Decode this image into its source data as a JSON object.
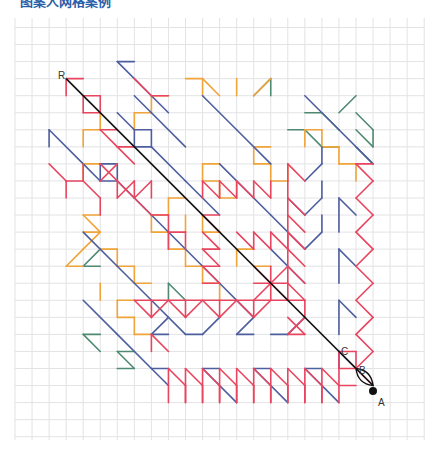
{
  "title": "图案人网格案例",
  "grid": {
    "x0": 15,
    "y0": 27.5,
    "step": 17.05,
    "cols": 24,
    "rows": 24,
    "top": 18,
    "bottom": 440,
    "left": 15,
    "right": 425,
    "color": "#e3e3e6"
  },
  "colors": {
    "blue": "#4d5f9e",
    "orange": "#f0a43a",
    "red": "#e8455f",
    "green": "#4f8a72",
    "black": "#111111"
  },
  "labels": [
    {
      "text": "R",
      "x": 58,
      "y": 79
    },
    {
      "text": "C",
      "x": 341,
      "y": 355
    },
    {
      "text": "B",
      "x": 359,
      "y": 374
    },
    {
      "text": "A",
      "x": 378,
      "y": 406
    }
  ],
  "point_a": {
    "x": 373,
    "y": 391
  },
  "main_diagonal": {
    "from": [
      3,
      3
    ],
    "to": [
      21,
      21
    ]
  },
  "segments": {
    "blue": [
      [
        6,
        2,
        7,
        2
      ],
      [
        6,
        2,
        8,
        4
      ],
      [
        8,
        4,
        9,
        5
      ],
      [
        6,
        5,
        7,
        6
      ],
      [
        7,
        6,
        8,
        6
      ],
      [
        8,
        6,
        8,
        7
      ],
      [
        7,
        6,
        7,
        7
      ],
      [
        7,
        7,
        8,
        7
      ],
      [
        8,
        7,
        10,
        9
      ],
      [
        2,
        6,
        2,
        7
      ],
      [
        2,
        6,
        4,
        8
      ],
      [
        4,
        8,
        5,
        9
      ],
      [
        5,
        8,
        6,
        8
      ],
      [
        5,
        8,
        5,
        9
      ],
      [
        5,
        9,
        6,
        9
      ],
      [
        6,
        9,
        7,
        10
      ],
      [
        6,
        8,
        6,
        9
      ],
      [
        7,
        4,
        8,
        5
      ],
      [
        8,
        5,
        10,
        7
      ],
      [
        11,
        4,
        13,
        6
      ],
      [
        13,
        6,
        15,
        8
      ],
      [
        17,
        4,
        19,
        6
      ],
      [
        19,
        6,
        21,
        8
      ],
      [
        12,
        8,
        15,
        11
      ],
      [
        15,
        11,
        17,
        13
      ],
      [
        10,
        9,
        12,
        11
      ],
      [
        4,
        12,
        6,
        14
      ],
      [
        6,
        14,
        8,
        16
      ],
      [
        8,
        16,
        10,
        18
      ],
      [
        7,
        10,
        8,
        11
      ],
      [
        8,
        11,
        12,
        15
      ],
      [
        12,
        15,
        14,
        17
      ],
      [
        15,
        13,
        17,
        15
      ],
      [
        4,
        16,
        6,
        18
      ],
      [
        6,
        18,
        8,
        20
      ],
      [
        8,
        18,
        9,
        17
      ],
      [
        9,
        18,
        8,
        18
      ],
      [
        10,
        18,
        11,
        18
      ],
      [
        11,
        18,
        12,
        17
      ],
      [
        13,
        18,
        14,
        17
      ],
      [
        14,
        18,
        13,
        18
      ],
      [
        16,
        18,
        17,
        17
      ],
      [
        16,
        18,
        15,
        18
      ],
      [
        8,
        20,
        9,
        20
      ],
      [
        8,
        20,
        9,
        21
      ],
      [
        11,
        20,
        12,
        20
      ],
      [
        11,
        20,
        13,
        22
      ],
      [
        14,
        20,
        15,
        20
      ],
      [
        14,
        20,
        16,
        22
      ],
      [
        17,
        20,
        18,
        20
      ],
      [
        17,
        20,
        19,
        22
      ],
      [
        17,
        11,
        18,
        10
      ],
      [
        17,
        11,
        16,
        10
      ],
      [
        18,
        10,
        18,
        9
      ],
      [
        17,
        9,
        18,
        8
      ],
      [
        18,
        8,
        18,
        7
      ],
      [
        17,
        13,
        18,
        12
      ],
      [
        18,
        12,
        18,
        11
      ],
      [
        19,
        10,
        19,
        12
      ],
      [
        19,
        10,
        20,
        11
      ],
      [
        19,
        13,
        19,
        15
      ],
      [
        19,
        13,
        20,
        14
      ],
      [
        19,
        16,
        19,
        18
      ],
      [
        19,
        16,
        20,
        17
      ],
      [
        19,
        19,
        19,
        20
      ],
      [
        19,
        19,
        20,
        20
      ]
    ],
    "orange": [
      [
        10,
        3,
        11,
        3
      ],
      [
        11,
        3,
        11,
        4
      ],
      [
        8,
        4,
        9,
        4
      ],
      [
        8,
        5,
        8,
        4
      ],
      [
        11,
        3,
        12,
        4
      ],
      [
        13,
        3,
        13,
        4
      ],
      [
        14,
        4,
        15,
        3
      ],
      [
        4,
        6,
        5,
        6
      ],
      [
        4,
        6,
        4,
        7
      ],
      [
        5,
        6,
        5,
        5
      ],
      [
        7,
        5,
        8,
        5
      ],
      [
        7,
        5,
        7,
        6
      ],
      [
        4,
        8,
        5,
        8
      ],
      [
        4,
        8,
        4,
        9
      ],
      [
        11,
        8,
        12,
        8
      ],
      [
        11,
        8,
        11,
        9
      ],
      [
        11,
        9,
        12,
        9
      ],
      [
        12,
        9,
        12,
        10
      ],
      [
        12,
        10,
        13,
        10
      ],
      [
        13,
        9,
        13,
        10
      ],
      [
        14,
        7,
        15,
        7
      ],
      [
        14,
        7,
        14,
        8
      ],
      [
        14,
        8,
        15,
        8
      ],
      [
        15,
        8,
        15,
        9
      ],
      [
        15,
        9,
        16,
        9
      ],
      [
        16,
        8,
        16,
        9
      ],
      [
        17,
        6,
        17,
        7
      ],
      [
        17,
        6,
        18,
        6
      ],
      [
        18,
        6,
        18,
        7
      ],
      [
        18,
        7,
        19,
        7
      ],
      [
        19,
        7,
        19,
        8
      ],
      [
        19,
        8,
        20,
        8
      ],
      [
        20,
        8,
        20,
        9
      ],
      [
        9,
        10,
        10,
        10
      ],
      [
        9,
        10,
        9,
        11
      ],
      [
        10,
        11,
        10,
        12
      ],
      [
        11,
        12,
        12,
        12
      ],
      [
        11,
        11,
        11,
        12
      ],
      [
        4,
        11,
        5,
        11
      ],
      [
        4,
        11,
        5,
        12
      ],
      [
        5,
        12,
        4,
        12
      ],
      [
        4,
        13,
        5,
        12
      ],
      [
        4,
        13,
        3,
        14
      ],
      [
        3,
        14,
        4,
        14
      ],
      [
        8,
        11,
        9,
        11
      ],
      [
        8,
        11,
        8,
        12
      ],
      [
        8,
        12,
        9,
        12
      ],
      [
        9,
        12,
        9,
        13
      ],
      [
        9,
        13,
        10,
        13
      ],
      [
        10,
        13,
        10,
        14
      ],
      [
        10,
        14,
        11,
        14
      ],
      [
        11,
        14,
        11,
        15
      ],
      [
        11,
        15,
        12,
        15
      ],
      [
        12,
        15,
        12,
        16
      ],
      [
        5,
        13,
        6,
        13
      ],
      [
        6,
        13,
        6,
        14
      ],
      [
        6,
        14,
        7,
        14
      ],
      [
        7,
        14,
        7,
        15
      ],
      [
        7,
        15,
        8,
        15
      ],
      [
        5,
        15,
        5,
        16
      ],
      [
        6,
        16,
        7,
        16
      ],
      [
        6,
        16,
        6,
        17
      ],
      [
        6,
        17,
        7,
        17
      ],
      [
        7,
        17,
        7,
        18
      ],
      [
        7,
        18,
        8,
        18
      ],
      [
        13,
        13,
        14,
        13
      ],
      [
        13,
        13,
        13,
        14
      ],
      [
        14,
        14,
        15,
        14
      ]
    ],
    "red": [
      [
        3,
        3,
        3,
        4
      ],
      [
        3,
        3,
        4,
        3
      ],
      [
        4,
        4,
        5,
        4
      ],
      [
        4,
        4,
        4,
        5
      ],
      [
        5,
        4,
        5,
        5
      ],
      [
        4,
        5,
        5,
        5
      ],
      [
        5,
        6,
        6,
        6
      ],
      [
        5,
        6,
        6,
        7
      ],
      [
        6,
        7,
        7,
        7
      ],
      [
        6,
        7,
        7,
        8
      ],
      [
        7,
        3,
        8,
        4
      ],
      [
        8,
        4,
        9,
        4
      ],
      [
        2,
        8,
        3,
        9
      ],
      [
        3,
        9,
        4,
        9
      ],
      [
        3,
        9,
        3,
        10
      ],
      [
        4,
        9,
        4,
        8
      ],
      [
        4,
        9,
        5,
        10
      ],
      [
        5,
        10,
        5,
        11
      ],
      [
        6,
        9,
        6,
        10
      ],
      [
        6,
        10,
        7,
        9
      ],
      [
        7,
        9,
        7,
        10
      ],
      [
        7,
        10,
        8,
        9
      ],
      [
        8,
        9,
        8,
        10
      ],
      [
        5,
        8,
        7,
        10
      ],
      [
        6,
        8,
        5,
        9
      ],
      [
        7,
        10,
        8,
        11
      ],
      [
        8,
        11,
        9,
        11
      ],
      [
        9,
        11,
        9,
        12
      ],
      [
        9,
        12,
        10,
        12
      ],
      [
        10,
        12,
        10,
        13
      ],
      [
        9,
        12,
        9,
        13
      ],
      [
        11,
        9,
        11,
        10
      ],
      [
        11,
        9,
        12,
        10
      ],
      [
        12,
        10,
        12,
        9
      ],
      [
        12,
        9,
        13,
        10
      ],
      [
        13,
        10,
        13,
        9
      ],
      [
        13,
        9,
        14,
        10
      ],
      [
        14,
        10,
        14,
        9
      ],
      [
        14,
        9,
        15,
        10
      ],
      [
        15,
        10,
        15,
        9
      ],
      [
        11,
        11,
        12,
        12
      ],
      [
        11,
        11,
        12,
        11
      ],
      [
        11,
        12,
        12,
        13
      ],
      [
        11,
        13,
        12,
        13
      ],
      [
        11,
        13,
        12,
        14
      ],
      [
        11,
        14,
        12,
        14
      ],
      [
        11,
        15,
        12,
        15
      ],
      [
        11,
        14,
        12,
        15
      ],
      [
        13,
        12,
        14,
        13
      ],
      [
        14,
        13,
        14,
        12
      ],
      [
        14,
        12,
        15,
        13
      ],
      [
        15,
        13,
        15,
        12
      ],
      [
        15,
        12,
        16,
        13
      ],
      [
        16,
        13,
        16,
        12
      ],
      [
        14,
        14,
        15,
        15
      ],
      [
        15,
        15,
        16,
        14
      ],
      [
        15,
        15,
        14,
        16
      ],
      [
        15,
        15,
        16,
        16
      ],
      [
        15,
        14,
        15,
        16
      ],
      [
        14,
        15,
        16,
        15
      ],
      [
        16,
        10,
        16,
        16
      ],
      [
        16,
        10,
        17,
        11
      ],
      [
        16,
        11,
        17,
        12
      ],
      [
        16,
        12,
        17,
        13
      ],
      [
        16,
        13,
        17,
        14
      ],
      [
        16,
        14,
        17,
        15
      ],
      [
        16,
        15,
        17,
        16
      ],
      [
        16,
        16,
        17,
        16
      ],
      [
        16,
        9,
        16,
        10
      ],
      [
        16,
        8,
        17,
        9
      ],
      [
        16,
        8,
        16,
        9
      ],
      [
        17,
        16,
        17,
        17
      ],
      [
        16,
        17,
        17,
        18
      ],
      [
        16,
        18,
        17,
        17
      ],
      [
        16,
        18,
        17,
        18
      ],
      [
        7,
        16,
        16,
        16
      ],
      [
        7,
        16,
        8,
        17
      ],
      [
        8,
        16,
        8,
        17
      ],
      [
        8,
        17,
        9,
        16
      ],
      [
        9,
        16,
        10,
        17
      ],
      [
        10,
        16,
        10,
        17
      ],
      [
        10,
        17,
        11,
        16
      ],
      [
        11,
        16,
        12,
        17
      ],
      [
        12,
        16,
        12,
        17
      ],
      [
        12,
        17,
        13,
        16
      ],
      [
        13,
        16,
        14,
        17
      ],
      [
        14,
        16,
        14,
        17
      ],
      [
        14,
        17,
        15,
        16
      ],
      [
        8,
        19,
        8,
        18
      ],
      [
        8,
        18,
        9,
        19
      ],
      [
        20,
        8,
        21,
        8
      ],
      [
        20,
        8,
        21,
        9
      ],
      [
        21,
        9,
        20,
        10
      ],
      [
        20,
        10,
        21,
        11
      ],
      [
        21,
        11,
        20,
        12
      ],
      [
        20,
        12,
        21,
        13
      ],
      [
        21,
        13,
        20,
        14
      ],
      [
        20,
        14,
        21,
        15
      ],
      [
        21,
        15,
        20,
        16
      ],
      [
        20,
        16,
        21,
        17
      ],
      [
        21,
        17,
        20,
        18
      ],
      [
        20,
        18,
        21,
        19
      ],
      [
        21,
        19,
        20,
        20
      ],
      [
        20,
        20,
        21,
        21
      ],
      [
        9,
        20,
        9,
        22
      ],
      [
        9,
        20,
        10,
        21
      ],
      [
        10,
        21,
        10,
        22
      ],
      [
        10,
        22,
        10,
        20
      ],
      [
        10,
        20,
        11,
        21
      ],
      [
        11,
        21,
        11,
        22
      ],
      [
        11,
        22,
        11,
        20
      ],
      [
        11,
        20,
        12,
        21
      ],
      [
        12,
        21,
        12,
        22
      ],
      [
        12,
        22,
        12,
        20
      ],
      [
        12,
        20,
        13,
        21
      ],
      [
        13,
        21,
        13,
        22
      ],
      [
        13,
        22,
        13,
        20
      ],
      [
        13,
        20,
        14,
        21
      ],
      [
        14,
        21,
        14,
        22
      ],
      [
        14,
        22,
        14,
        20
      ],
      [
        14,
        20,
        15,
        21
      ],
      [
        15,
        21,
        15,
        22
      ],
      [
        15,
        22,
        15,
        20
      ],
      [
        15,
        20,
        16,
        21
      ],
      [
        16,
        21,
        16,
        22
      ],
      [
        16,
        22,
        16,
        20
      ],
      [
        16,
        20,
        17,
        21
      ],
      [
        17,
        21,
        17,
        22
      ],
      [
        17,
        22,
        17,
        20
      ],
      [
        17,
        20,
        18,
        21
      ],
      [
        18,
        21,
        18,
        22
      ],
      [
        18,
        22,
        18,
        20
      ],
      [
        18,
        20,
        19,
        21
      ],
      [
        19,
        21,
        19,
        22
      ],
      [
        19,
        19,
        19,
        21
      ],
      [
        19,
        19,
        20,
        19
      ],
      [
        20,
        19,
        20,
        20
      ],
      [
        19,
        20,
        20,
        20
      ],
      [
        19,
        21,
        20,
        21
      ]
    ],
    "green": [
      [
        14,
        4,
        15,
        3
      ],
      [
        15,
        3,
        15,
        4
      ],
      [
        17,
        5,
        18,
        5
      ],
      [
        18,
        5,
        19,
        6
      ],
      [
        19,
        5,
        20,
        4
      ],
      [
        20,
        5,
        21,
        6
      ],
      [
        21,
        6,
        21,
        7
      ],
      [
        21,
        7,
        20,
        6
      ],
      [
        16,
        6,
        17,
        6
      ],
      [
        17,
        6,
        18,
        7
      ],
      [
        18,
        7,
        19,
        7
      ],
      [
        20,
        7,
        21,
        8
      ],
      [
        4,
        14,
        5,
        13
      ],
      [
        4,
        14,
        5,
        14
      ],
      [
        9,
        15,
        10,
        16
      ],
      [
        9,
        15,
        9,
        16
      ],
      [
        4,
        18,
        5,
        19
      ],
      [
        4,
        18,
        5,
        18
      ],
      [
        6,
        19,
        7,
        20
      ],
      [
        6,
        19,
        7,
        19
      ],
      [
        6,
        20,
        7,
        20
      ]
    ]
  }
}
